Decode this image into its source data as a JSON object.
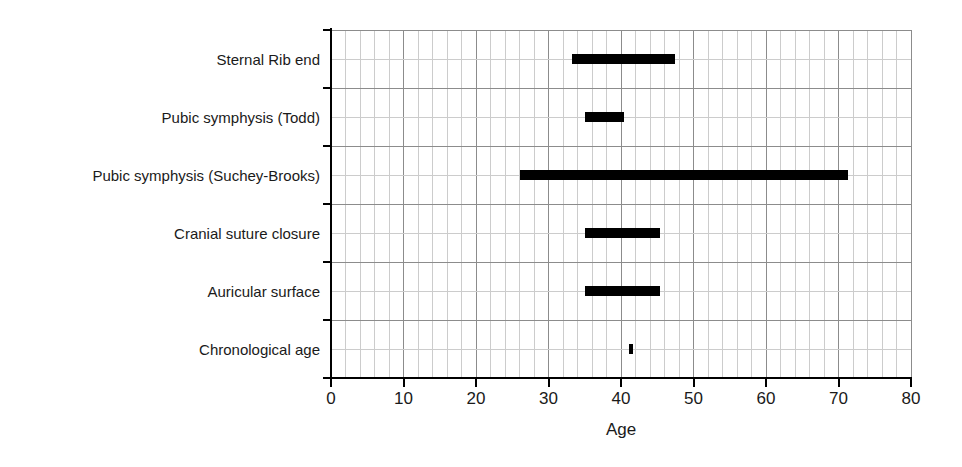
{
  "chart_data": {
    "type": "bar",
    "orientation": "horizontal",
    "title": "",
    "subtitle": "",
    "xlabel": "Age",
    "ylabel": "",
    "xlim": [
      0,
      80
    ],
    "x_tick_labels": [
      "0",
      "10",
      "20",
      "30",
      "40",
      "50",
      "60",
      "70",
      "80"
    ],
    "x_ticks": [
      0,
      10,
      20,
      30,
      40,
      50,
      60,
      70,
      80
    ],
    "x_minor_step": 2,
    "grid": true,
    "legend": "none",
    "categories": [
      "Sternal Rib end",
      "Pubic symphysis (Todd)",
      "Pubic symphysis (Suchey-Brooks)",
      "Cranial suture closure",
      "Auricular surface",
      "Chronological age"
    ],
    "ranges": [
      {
        "label": "Sternal Rib end",
        "start": 33.3,
        "end": 47.5
      },
      {
        "label": "Pubic symphysis (Todd)",
        "start": 35.0,
        "end": 40.4
      },
      {
        "label": "Pubic symphysis (Suchey-Brooks)",
        "start": 26.1,
        "end": 71.3
      },
      {
        "label": "Cranial suture closure",
        "start": 35.0,
        "end": 45.4
      },
      {
        "label": "Auricular surface",
        "start": 35.0,
        "end": 45.4
      },
      {
        "label": "Chronological age",
        "start": 41.1,
        "end": 41.7
      }
    ],
    "bar_color": "#000000",
    "grid_color": "#b4b4b4",
    "axis_color": "#000000"
  }
}
